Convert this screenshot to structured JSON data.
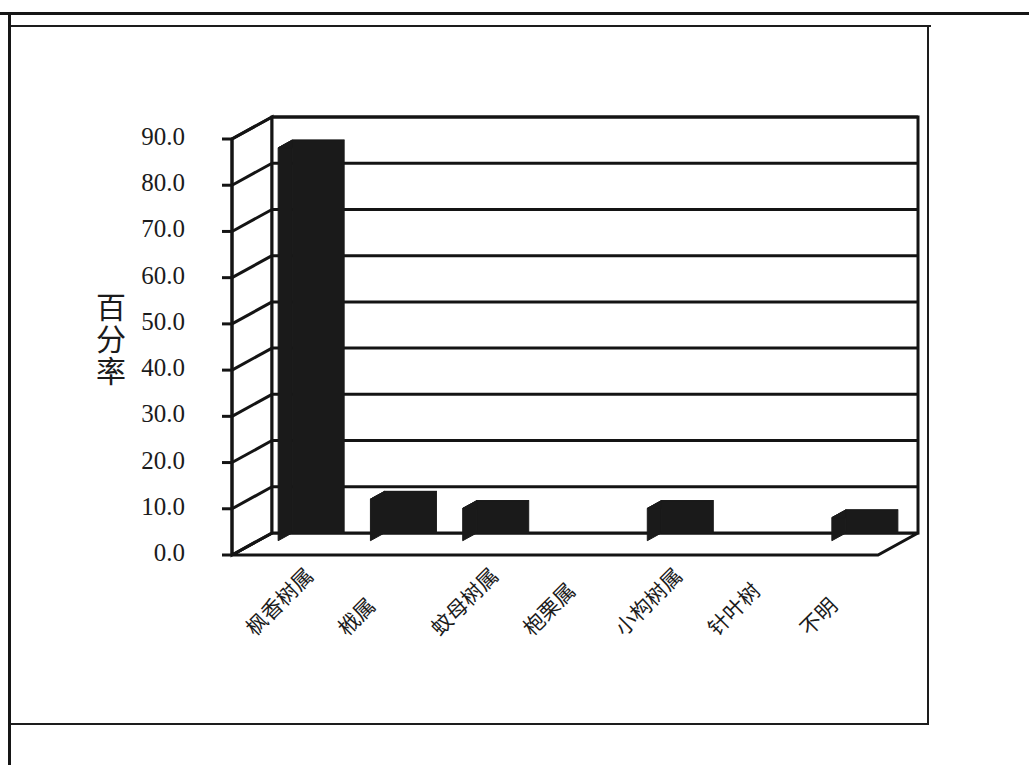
{
  "figure": {
    "frame_color": "#161616",
    "background": "#ffffff"
  },
  "chart_data": {
    "type": "bar",
    "title": "",
    "subtitle": "",
    "xlabel": "",
    "ylabel": "百分率",
    "categories": [
      "枫香树属",
      "栰属",
      "蚊母树属",
      "枹栗属",
      "小构树属",
      "针叶树",
      "不明"
    ],
    "values": [
      85.0,
      9.0,
      7.0,
      0.0,
      7.0,
      0.0,
      5.0
    ],
    "ylim": [
      0.0,
      90.0
    ],
    "yticks": [
      0.0,
      10.0,
      20.0,
      30.0,
      40.0,
      50.0,
      60.0,
      70.0,
      80.0,
      90.0
    ],
    "ytick_labels": [
      "0.0",
      "10.0",
      "20.0",
      "30.0",
      "40.0",
      "50.0",
      "60.0",
      "70.0",
      "80.0",
      "90.0"
    ],
    "grid": true,
    "grid_axis": "y",
    "legend": null,
    "legend_position": "none",
    "style": "3d-column",
    "bar_color": "#1a1a1a",
    "axis_color": "#141414"
  },
  "axis": {
    "y_title": "百分率"
  }
}
